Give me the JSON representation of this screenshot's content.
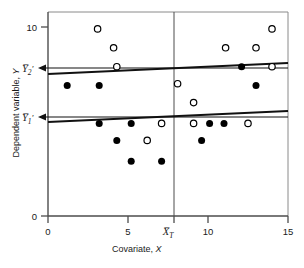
{
  "chart_data": {
    "type": "scatter",
    "title": "",
    "xlabel": "Covariate, X",
    "ylabel": "Dependent variable, Y",
    "xlim": [
      0,
      15
    ],
    "ylim": [
      0,
      10.6
    ],
    "grid": false,
    "legend_position": "none",
    "x_ticks": [
      {
        "value": 0,
        "label": "0"
      },
      {
        "value": 5,
        "label": "5"
      },
      {
        "value": 7.9,
        "label": "X̄T"
      },
      {
        "value": 10,
        "label": "10"
      },
      {
        "value": 15,
        "label": "15"
      }
    ],
    "y_ticks": [
      {
        "value": 0,
        "label": "0"
      },
      {
        "value": 10,
        "label": "10"
      }
    ],
    "series": [
      {
        "name": "Group 2 (open circles)",
        "marker": "open-circle",
        "color": "#000000",
        "points": [
          {
            "x": 3.1,
            "y": 9.9
          },
          {
            "x": 4.1,
            "y": 8.9
          },
          {
            "x": 4.3,
            "y": 7.9
          },
          {
            "x": 8.1,
            "y": 7.0
          },
          {
            "x": 11.1,
            "y": 8.9
          },
          {
            "x": 13.0,
            "y": 8.9
          },
          {
            "x": 14.0,
            "y": 9.9
          },
          {
            "x": 14.0,
            "y": 7.9
          },
          {
            "x": 9.1,
            "y": 6.0
          },
          {
            "x": 7.1,
            "y": 4.9
          },
          {
            "x": 9.1,
            "y": 4.9
          },
          {
            "x": 6.2,
            "y": 4.0
          },
          {
            "x": 12.5,
            "y": 4.9
          }
        ]
      },
      {
        "name": "Group 1 (filled circles)",
        "marker": "filled-circle",
        "color": "#000000",
        "points": [
          {
            "x": 1.2,
            "y": 6.9
          },
          {
            "x": 3.2,
            "y": 6.9
          },
          {
            "x": 12.1,
            "y": 7.9
          },
          {
            "x": 13.0,
            "y": 6.9
          },
          {
            "x": 3.2,
            "y": 4.9
          },
          {
            "x": 5.2,
            "y": 4.9
          },
          {
            "x": 10.1,
            "y": 4.9
          },
          {
            "x": 11.0,
            "y": 4.9
          },
          {
            "x": 4.3,
            "y": 4.0
          },
          {
            "x": 9.6,
            "y": 4.0
          },
          {
            "x": 5.2,
            "y": 2.9
          },
          {
            "x": 7.1,
            "y": 2.9
          }
        ]
      }
    ],
    "fit_lines": [
      {
        "name": "Group 2 regression line",
        "x_start": 0,
        "y_start": 7.5,
        "x_end": 15,
        "y_end": 8.1
      },
      {
        "name": "Group 1 regression line",
        "x_start": 0,
        "y_start": 5.0,
        "x_end": 15,
        "y_end": 5.6
      }
    ],
    "annotations": [
      {
        "name": "adjusted-mean-2",
        "label": "Ȳ2′",
        "y": 7.85,
        "arrow": "left"
      },
      {
        "name": "adjusted-mean-1",
        "label": "Ȳ1′",
        "y": 5.25,
        "arrow": "left"
      },
      {
        "name": "covariate-grand-mean",
        "label": "X̄T",
        "x": 7.9,
        "type": "vertical-line"
      }
    ]
  },
  "axis_labels": {
    "y_title_prefix": "Dependent variable, ",
    "y_title_var": "Y",
    "x_title_prefix": "Covariate, ",
    "x_title_var": "X"
  },
  "tick_labels": {
    "y_top": "10",
    "y_zero": "0",
    "x_zero": "0",
    "x_five": "5",
    "x_ten": "10",
    "x_fifteen": "15"
  },
  "mean_labels": {
    "y2": "Y",
    "y2_sub": "2",
    "y2_prime": "′",
    "y1": "Y",
    "y1_sub": "1",
    "y1_prime": "′",
    "xt": "X",
    "xt_sub": "T"
  },
  "colors": {
    "axis": "#4d4d4d",
    "frame": "#7a7a7a",
    "marker": "#000000",
    "line": "#1a1a1a",
    "background": "#ffffff"
  }
}
